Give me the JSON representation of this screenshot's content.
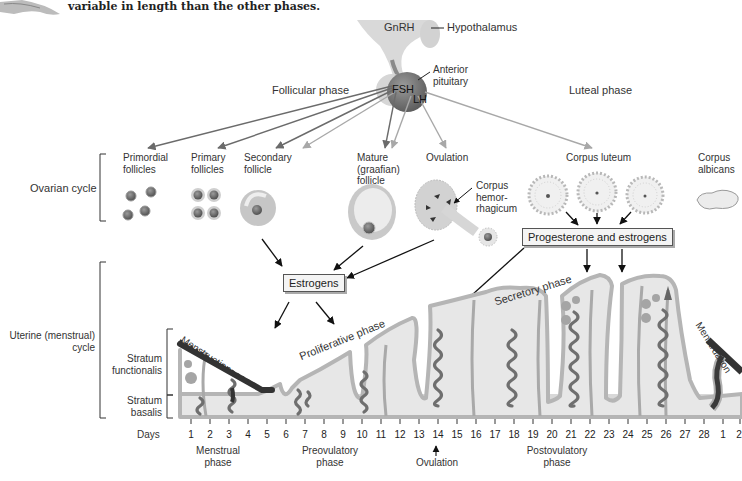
{
  "caption": "variable in length than the other phases.",
  "brain": {
    "gnrh": "GnRH",
    "hypothalamus": "Hypothalamus",
    "anterior_pituitary": "Anterior\npituitary",
    "fsh": "FSH",
    "lh": "LH"
  },
  "phases_top": {
    "follicular": "Follicular phase",
    "luteal": "Luteal phase"
  },
  "ovarian": {
    "cycle_label": "Ovarian cycle",
    "stages": [
      {
        "id": "primordial",
        "label": "Primordial\nfollicles"
      },
      {
        "id": "primary",
        "label": "Primary\nfollicles"
      },
      {
        "id": "secondary",
        "label": "Secondary\nfollicle"
      },
      {
        "id": "mature",
        "label": "Mature\n(graafian)\nfollicle"
      },
      {
        "id": "ovulation",
        "label": "Ovulation"
      },
      {
        "id": "corpus_hemorrhagicum",
        "label": "Corpus\nhemor-\nrhagicum"
      },
      {
        "id": "corpus_luteum",
        "label": "Corpus luteum"
      },
      {
        "id": "corpus_albicans",
        "label": "Corpus\nalbicans"
      }
    ]
  },
  "hormones": {
    "estrogens": "Estrogens",
    "progesterone": "Progesterone and estrogens"
  },
  "uterine": {
    "cycle_label": "Uterine (menstrual)\ncycle",
    "functionalis": "Stratum\nfunctionalis",
    "basalis": "Stratum\nbasalis",
    "menstruation_1": "Menstruation",
    "proliferative": "Proliferative phase",
    "secretory": "Secretory phase",
    "menstruation_2": "Menstruation"
  },
  "timeline": {
    "days_label": "Days",
    "days": [
      "1",
      "2",
      "3",
      "4",
      "5",
      "6",
      "7",
      "8",
      "9",
      "10",
      "11",
      "12",
      "13",
      "14",
      "15",
      "16",
      "17",
      "18",
      "19",
      "20",
      "21",
      "22",
      "23",
      "24",
      "25",
      "26",
      "27",
      "28",
      "1",
      "2"
    ],
    "phases": [
      {
        "label": "Menstrual\nphase"
      },
      {
        "label": "Preovulatory\nphase"
      },
      {
        "label": "Ovulation"
      },
      {
        "label": "Postovulatory\nphase"
      }
    ]
  },
  "colors": {
    "fsh_arrow": "#6b6b6b",
    "lh_arrow": "#a8a8a8",
    "tissue_light": "#e6e6e6",
    "tissue_outline": "#b5b5b5",
    "basalis": "#d7d7d7",
    "vessel_dark": "#707070",
    "menses": "#333333"
  }
}
